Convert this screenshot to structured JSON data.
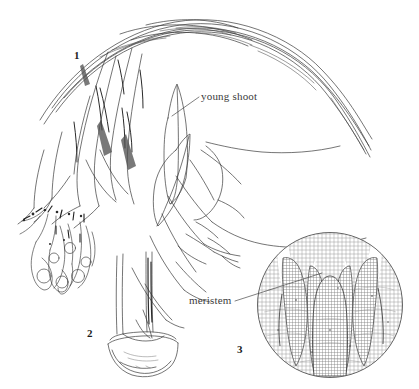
{
  "illustration": {
    "title": "Vegetative propagation of a bulbous plant",
    "background_color": "#ffffff",
    "ink_color": "#3b3b3b",
    "width": 419,
    "height": 389
  },
  "callouts": [
    {
      "id": "young-shoot",
      "text": "young shoot",
      "leader_from_x": 199,
      "leader_from_y": 97,
      "leader_to_x": 172,
      "leader_to_y": 116
    },
    {
      "id": "meristem",
      "text": "meristem",
      "leader_from_x": 235,
      "leader_from_y": 301,
      "leader_to_x": 322,
      "leader_to_y": 273
    }
  ],
  "figure_numbers": [
    {
      "id": "1",
      "label": "1",
      "subject": "leafy-shoot-with-bulb-and-roots"
    },
    {
      "id": "2",
      "label": "2",
      "subject": "cut-stem-in-basal-cup"
    },
    {
      "id": "3",
      "label": "3",
      "subject": "magnified-shoot-apex-section"
    }
  ],
  "panels": {
    "panel1": {
      "name": "whole plant with arching leaves",
      "number": "1"
    },
    "panel2": {
      "name": "trimmed stem base in dish",
      "number": "2"
    },
    "panel3": {
      "name": "circular magnified meristem section",
      "number": "3",
      "center_x": 330,
      "center_y": 305,
      "radius": 73
    }
  }
}
